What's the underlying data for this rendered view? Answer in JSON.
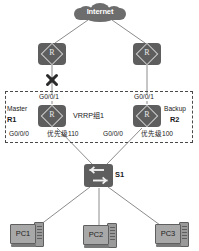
{
  "diagram": {
    "cloud": {
      "label": "Internet",
      "icon": "cloud-icon"
    },
    "core_routers": [
      {
        "id": "core-left",
        "icon": "router-icon",
        "link_status": "failed"
      },
      {
        "id": "core-right",
        "icon": "router-icon",
        "link_status": "up"
      }
    ],
    "vrrp_group": {
      "label": "VRRP组1",
      "routers": [
        {
          "id": "r1",
          "role": "Master",
          "name": "R1",
          "uplink_interface": "G0/0/1",
          "downlink_interface": "G0/0/0",
          "priority": "优先级110",
          "icon": "router-icon"
        },
        {
          "id": "r2",
          "role": "Backup",
          "name": "R2",
          "uplink_interface": "G0/0/1",
          "downlink_interface": "G0/0/0",
          "priority": "优先级100",
          "icon": "router-icon"
        }
      ]
    },
    "switch": {
      "name": "S1",
      "icon": "switch-icon"
    },
    "hosts": [
      {
        "name": "PC1",
        "icon": "pc-icon"
      },
      {
        "name": "PC2",
        "icon": "pc-icon"
      },
      {
        "name": "PC3",
        "icon": "pc-icon"
      }
    ],
    "failure_marker": {
      "icon": "link-failure-x-icon",
      "on_link": "core-left-to-r1"
    },
    "colors": {
      "device_fill": "#5e5e5e",
      "cloud_fill": "#6d6d6d",
      "wire": "#8c8c8c",
      "dashed_border": "#4a4a4a",
      "text": "#1a1a1a",
      "pc_screen": "#a8a8a8"
    }
  }
}
